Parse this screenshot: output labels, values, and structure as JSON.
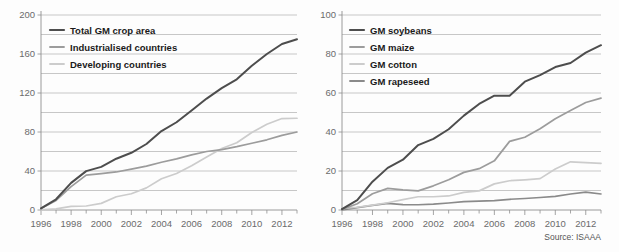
{
  "figure": {
    "source": "Source: ISAAA",
    "colors": {
      "dark": "#4d4d4d",
      "medium": "#9c9c9c",
      "light": "#cccccc",
      "mid_dark": "#8a8a8a",
      "grid": "#b9b9b9",
      "axis": "#8e8e8e",
      "background": "#fdfdfd",
      "text": "#1a1a1a",
      "tick_text": "#6b6b6b"
    }
  },
  "chart_data": [
    {
      "type": "line",
      "panel": "left",
      "title": "",
      "xlabel": "",
      "ylabel": "",
      "xlim": [
        1996,
        2013
      ],
      "ylim": [
        0,
        200
      ],
      "grid": true,
      "legend_position": "top-left",
      "xticks": [
        1996,
        1998,
        2000,
        2002,
        2004,
        2006,
        2008,
        2010,
        2012
      ],
      "xtick_labels": [
        "1996",
        "1998",
        "2000",
        "2002",
        "2004",
        "2006",
        "2008",
        "2010",
        "2012"
      ],
      "yticks": [
        0,
        40,
        80,
        120,
        160,
        200
      ],
      "ytick_labels": [
        "0",
        "40",
        "80",
        "120",
        "160",
        "200"
      ],
      "minor_yticks": [
        20,
        60,
        100,
        140,
        180
      ],
      "x": [
        1996,
        1997,
        1998,
        1999,
        2000,
        2001,
        2002,
        2003,
        2004,
        2005,
        2006,
        2007,
        2008,
        2009,
        2010,
        2011,
        2012,
        2013
      ],
      "series": [
        {
          "name": "Total GM crop area",
          "color_key": "dark",
          "values": [
            1.7,
            11.0,
            27.8,
            39.9,
            44.2,
            52.6,
            58.7,
            67.7,
            81.0,
            90.0,
            102.0,
            114.3,
            125.0,
            134.0,
            148.0,
            160.0,
            170.3,
            175.2
          ]
        },
        {
          "name": "Industrialised countries",
          "color_key": "medium",
          "values": [
            1.5,
            9.8,
            24.0,
            35.8,
            37.4,
            39.0,
            42.0,
            45.0,
            49.0,
            52.5,
            56.5,
            60.0,
            62.0,
            65.0,
            68.5,
            72.0,
            76.5,
            80.0
          ]
        },
        {
          "name": "Developing countries",
          "color_key": "light",
          "values": [
            0.2,
            1.2,
            3.8,
            4.1,
            6.8,
            13.6,
            16.7,
            22.7,
            32.0,
            37.5,
            45.5,
            54.3,
            63.0,
            69.0,
            79.5,
            88.0,
            93.8,
            94.1
          ]
        }
      ]
    },
    {
      "type": "line",
      "panel": "right",
      "title": "",
      "xlabel": "",
      "ylabel": "",
      "xlim": [
        1996,
        2013
      ],
      "ylim": [
        0,
        100
      ],
      "grid": true,
      "legend_position": "top-left",
      "xticks": [
        1996,
        1998,
        2000,
        2002,
        2004,
        2006,
        2008,
        2010,
        2012
      ],
      "xtick_labels": [
        "1996",
        "1998",
        "2000",
        "2002",
        "2004",
        "2006",
        "2008",
        "2010",
        "2012"
      ],
      "yticks": [
        0,
        20,
        40,
        60,
        80,
        100
      ],
      "ytick_labels": [
        "0",
        "20",
        "40",
        "60",
        "80",
        "100"
      ],
      "minor_yticks": [
        10,
        30,
        50,
        70,
        90
      ],
      "x": [
        1996,
        1997,
        1998,
        1999,
        2000,
        2001,
        2002,
        2003,
        2004,
        2005,
        2006,
        2007,
        2008,
        2009,
        2010,
        2011,
        2012,
        2013
      ],
      "series": [
        {
          "name": "GM soybeans",
          "color_key": "dark",
          "values": [
            0.5,
            5.1,
            14.5,
            21.6,
            25.8,
            33.3,
            36.5,
            41.4,
            48.4,
            54.4,
            58.6,
            58.6,
            65.8,
            69.2,
            73.3,
            75.4,
            80.7,
            84.5
          ]
        },
        {
          "name": "GM maize",
          "color_key": "medium",
          "values": [
            0.3,
            3.2,
            8.3,
            11.1,
            10.3,
            9.8,
            12.4,
            15.5,
            19.3,
            21.2,
            25.2,
            35.2,
            37.3,
            41.7,
            46.8,
            51.0,
            55.1,
            57.4
          ]
        },
        {
          "name": "GM cotton",
          "color_key": "light",
          "values": [
            0.8,
            1.4,
            2.5,
            3.7,
            5.3,
            6.8,
            6.8,
            7.2,
            9.0,
            9.8,
            13.4,
            15.0,
            15.5,
            16.1,
            21.0,
            24.7,
            24.3,
            23.9
          ]
        },
        {
          "name": "GM rapeseed",
          "color_key": "mid_dark",
          "values": [
            0.1,
            1.2,
            2.4,
            3.4,
            2.8,
            2.7,
            3.0,
            3.6,
            4.3,
            4.6,
            4.8,
            5.5,
            5.9,
            6.4,
            7.0,
            8.2,
            9.2,
            8.2
          ]
        }
      ]
    }
  ]
}
